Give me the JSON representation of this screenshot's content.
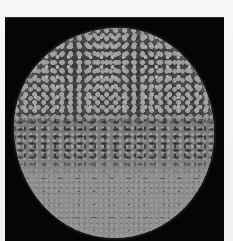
{
  "image": {
    "kind": "grayscale micrograph",
    "subject": "circular granular specimen on black background",
    "colors": {
      "border": "#f4f4f4",
      "background": "#050505",
      "specimen_dark": "#4a4a4a",
      "specimen_light": "#8c8c8c",
      "grain_highlight": "#a3a3a3"
    },
    "regions": [
      {
        "name": "upper",
        "description": "dark mottled network of bright granules"
      },
      {
        "name": "middle",
        "description": "transition with dark elongated streaks"
      },
      {
        "name": "lower",
        "description": "lighter, fine-grained uniform texture"
      }
    ]
  }
}
